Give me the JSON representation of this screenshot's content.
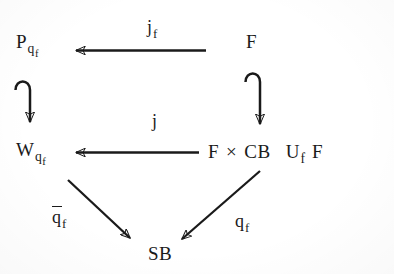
{
  "diagram": {
    "type": "commutative-diagram",
    "background_color": "#ffffff",
    "ink_color": "#1a1a1a",
    "nodes": [
      {
        "id": "P",
        "label_base": "P",
        "sub": "q",
        "subsub": "f",
        "position": "top-left"
      },
      {
        "id": "F_top",
        "label_base": "F",
        "sub": "",
        "subsub": "",
        "position": "top-right"
      },
      {
        "id": "W",
        "label_base": "W",
        "sub": "q",
        "subsub": "f",
        "position": "middle-left"
      },
      {
        "id": "Pushout",
        "label_base": "F",
        "sub": "",
        "subsub": "",
        "position": "middle-right"
      },
      {
        "id": "SB",
        "label_base": "SB",
        "sub": "",
        "subsub": "",
        "position": "bottom-center"
      }
    ],
    "pushout_expression": {
      "left_term": "F",
      "times_symbol": "×",
      "middle_term": "CB",
      "union_symbol": "U",
      "union_subscript": "f",
      "right_term": "F"
    },
    "edges": [
      {
        "id": "jf",
        "from": "F_top",
        "to": "P",
        "label_base": "j",
        "label_sub": "f",
        "overline": false,
        "style": "arrow-left",
        "direction": "horizontal"
      },
      {
        "id": "j",
        "from": "Pushout",
        "to": "W",
        "label_base": "j",
        "label_sub": "",
        "overline": false,
        "style": "arrow-left",
        "direction": "horizontal"
      },
      {
        "id": "hookL",
        "from": "P",
        "to": "W",
        "label_base": "",
        "label_sub": "",
        "overline": false,
        "style": "hook-arrow-down",
        "direction": "vertical"
      },
      {
        "id": "hookR",
        "from": "F_top",
        "to": "Pushout",
        "label_base": "",
        "label_sub": "",
        "overline": false,
        "style": "hook-arrow-down",
        "direction": "vertical"
      },
      {
        "id": "qbar",
        "from": "W",
        "to": "SB",
        "label_base": "q",
        "label_sub": "f",
        "overline": true,
        "style": "arrow-diagonal",
        "direction": "down-right"
      },
      {
        "id": "qf",
        "from": "Pushout",
        "to": "SB",
        "label_base": "q",
        "label_sub": "f",
        "overline": false,
        "style": "arrow-diagonal",
        "direction": "down-left"
      }
    ]
  },
  "labels": {
    "node_p_base": "P",
    "node_p_sub": "q",
    "node_p_subsub": "f",
    "node_f_top": "F",
    "node_w_base": "W",
    "node_w_sub": "q",
    "node_w_subsub": "f",
    "pushout_f1": "F",
    "pushout_times": "×",
    "pushout_cb": "CB",
    "pushout_u": "U",
    "pushout_u_sub": "f",
    "pushout_f2": "F",
    "node_sb": "SB",
    "edge_jf_base": "j",
    "edge_jf_sub": "f",
    "edge_j": "j",
    "edge_qbar_base": "q",
    "edge_qbar_sub": "f",
    "edge_qf_base": "q",
    "edge_qf_sub": "f"
  }
}
